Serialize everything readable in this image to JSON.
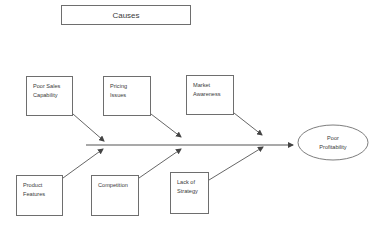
{
  "diagram": {
    "type": "fishbone",
    "title": "Causes",
    "effect": "Poor\nProfitability",
    "top_causes": [
      {
        "label": "Poor Sales\nCapability"
      },
      {
        "label": "Pricing\nIssues"
      },
      {
        "label": "Market\nAwareness"
      }
    ],
    "bottom_causes": [
      {
        "label": "Product\nFeatures"
      },
      {
        "label": "Competition"
      },
      {
        "label": "Lack of\nStrategy"
      }
    ],
    "colors": {
      "line": "#555555",
      "border": "#6e6e6e",
      "text": "#3a3a3a"
    }
  }
}
